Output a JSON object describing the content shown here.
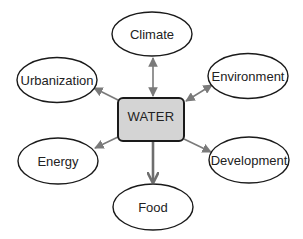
{
  "diagram": {
    "type": "hub-and-spoke",
    "center": {
      "label": "WATER",
      "fill": "#d4d4d4"
    },
    "nodes": [
      {
        "id": "climate",
        "label": "Climate"
      },
      {
        "id": "urbanization",
        "label": "Urbanization"
      },
      {
        "id": "environment",
        "label": "Environment"
      },
      {
        "id": "energy",
        "label": "Energy"
      },
      {
        "id": "development",
        "label": "Development"
      },
      {
        "id": "food",
        "label": "Food"
      }
    ],
    "edges": [
      {
        "from": "WATER",
        "to": "climate",
        "direction": "bidirectional"
      },
      {
        "from": "WATER",
        "to": "urbanization",
        "direction": "to"
      },
      {
        "from": "WATER",
        "to": "environment",
        "direction": "bidirectional"
      },
      {
        "from": "WATER",
        "to": "energy",
        "direction": "to"
      },
      {
        "from": "WATER",
        "to": "development",
        "direction": "to"
      },
      {
        "from": "WATER",
        "to": "food",
        "direction": "to",
        "emphasis": "thick"
      }
    ],
    "colors": {
      "edge": "#7a7a7a",
      "outline": "#1a1a1a",
      "center_fill": "#d4d4d4"
    }
  }
}
